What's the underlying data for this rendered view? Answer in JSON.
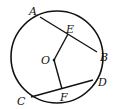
{
  "diagram": {
    "type": "geometry",
    "circle": {
      "center": "O",
      "cx": 57,
      "cy": 57,
      "r": 46
    },
    "points": {
      "A": {
        "label": "A",
        "x": 40,
        "y": 17,
        "lx": 29,
        "ly": 15
      },
      "B": {
        "label": "B",
        "x": 97,
        "y": 52,
        "lx": 100,
        "ly": 61
      },
      "C": {
        "label": "C",
        "x": 31,
        "y": 97,
        "lx": 17,
        "ly": 105
      },
      "D": {
        "label": "D",
        "x": 93,
        "y": 80,
        "lx": 98,
        "ly": 86
      },
      "E": {
        "label": "E",
        "x": 68,
        "y": 34,
        "lx": 67,
        "ly": 33
      },
      "F": {
        "label": "F",
        "x": 62,
        "y": 89,
        "lx": 61,
        "ly": 101
      },
      "O": {
        "label": "O",
        "x": 54,
        "y": 60,
        "lx": 41,
        "ly": 64
      }
    },
    "segments": [
      [
        "A",
        "B"
      ],
      [
        "C",
        "D"
      ],
      [
        "O",
        "E"
      ],
      [
        "O",
        "F"
      ]
    ],
    "colors": {
      "stroke": "#111111",
      "background": "#ffffff"
    }
  }
}
